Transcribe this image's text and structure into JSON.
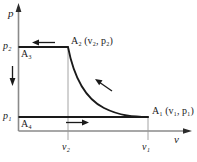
{
  "figure": {
    "type": "thermodynamic-pv-diagram",
    "axes": {
      "y_label": "p",
      "x_label": "v",
      "y_ticks": [
        {
          "name": "p2",
          "text_main": "p",
          "text_sub": "2",
          "y_px": 47
        },
        {
          "name": "p1",
          "text_main": "p",
          "text_sub": "1",
          "y_px": 117
        }
      ],
      "x_ticks": [
        {
          "name": "v2",
          "text_main": "v",
          "text_sub": "2",
          "x_px": 68
        },
        {
          "name": "v1",
          "text_main": "v",
          "text_sub": "1",
          "x_px": 148
        }
      ]
    },
    "states": [
      {
        "name": "A1",
        "letter": "A",
        "index": "1",
        "coords": "(v1, p1)",
        "coord_v": "v",
        "coord_v_sub": "1",
        "coord_p": "p",
        "coord_p_sub": "1",
        "x_px": 148,
        "y_px": 117
      },
      {
        "name": "A2",
        "letter": "A",
        "index": "2",
        "coords": "(v2, p2)",
        "coord_v": "v",
        "coord_v_sub": "2",
        "coord_p": "p",
        "coord_p_sub": "2",
        "x_px": 68,
        "y_px": 47
      },
      {
        "name": "A3",
        "letter": "A",
        "index": "3",
        "coords": "",
        "x_px": 18,
        "y_px": 47
      },
      {
        "name": "A4",
        "letter": "A",
        "index": "4",
        "coords": "",
        "x_px": 18,
        "y_px": 117
      }
    ],
    "labels": {
      "A2_full": "A₂ (v₂, p₂)",
      "A1_full": "A₁ (v₁, p₁)",
      "A3_short": "A₃",
      "A4_short": "A₄",
      "p2": "p₂",
      "p1": "p₁",
      "v2": "v₂",
      "v1": "v₁",
      "p_axis": "p",
      "v_axis": "v"
    },
    "arrows": [
      {
        "name": "top-isobar-arrow",
        "direction": "left",
        "on": "A2-to-A3 isobaric compression path",
        "x_px": 43,
        "y_px": 43
      },
      {
        "name": "left-vertical-arrow",
        "direction": "down",
        "on": "A3-to-A4 isochoric/pressure-drop path",
        "x_px": 13,
        "y_px": 77
      },
      {
        "name": "bottom-isobar-arrow",
        "direction": "right",
        "on": "A4-to-A1 isobaric expansion path",
        "x_px": 80,
        "y_px": 122
      },
      {
        "name": "curve-arrow",
        "direction": "up-left",
        "on": "A1-to-A2 isothermal path",
        "x_px": 103,
        "y_px": 84
      }
    ],
    "curve": {
      "name": "isotherm",
      "from": "A2",
      "to": "A1",
      "shape": "hyperbolic pv = const"
    },
    "colors": {
      "line": "#1a1a1a",
      "thin_line": "#808080",
      "background": "#ffffff"
    }
  }
}
